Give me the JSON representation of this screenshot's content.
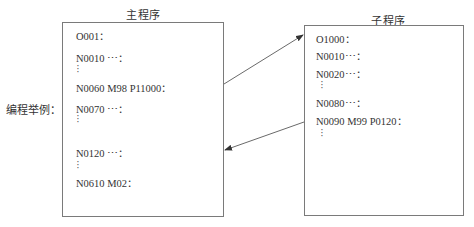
{
  "side_label": "编程举例：",
  "main_program": {
    "title": "主程序",
    "lines": [
      "O001：",
      "N0010 ⋯：",
      "N0060 M98 P11000：",
      "N0070 ⋯：",
      "N0120 ⋯：",
      "N0610 M02："
    ],
    "ellipsis": "⋮"
  },
  "sub_program": {
    "title": "子程序",
    "lines": [
      "O1000：",
      "N0010⋯：",
      "N0020⋯：",
      "N0080⋯：",
      "N0090 M99 P0120："
    ],
    "ellipsis": "⋮"
  },
  "arrows": [
    {
      "name": "call-arrow",
      "from": "N0060 M98 P11000",
      "to": "O1000"
    },
    {
      "name": "return-arrow",
      "from": "N0090 M99 P0120",
      "to": "N0120"
    }
  ],
  "colors": {
    "stroke": "#7a7a7a",
    "text": "#333333"
  }
}
